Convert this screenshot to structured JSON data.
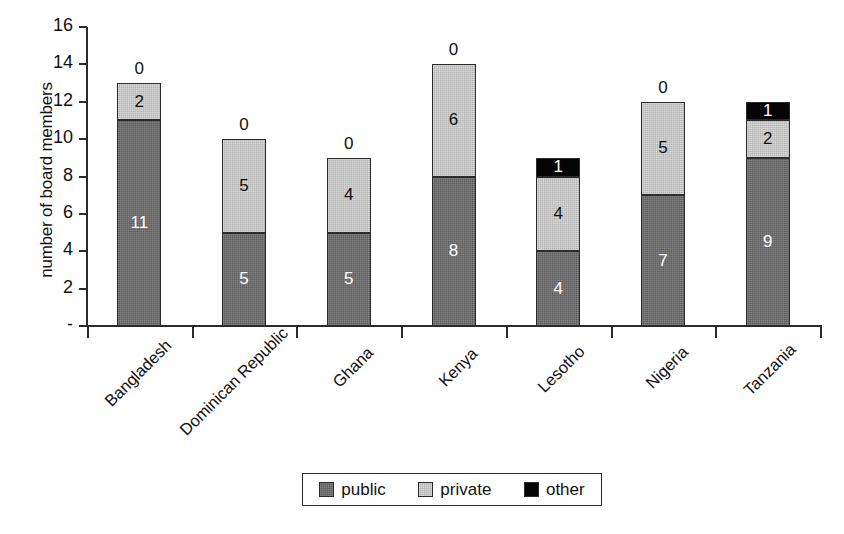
{
  "chart_data": {
    "type": "bar",
    "subtype": "stacked-bar",
    "title": "",
    "xlabel": "",
    "ylabel": "number of board members",
    "ylim": [
      0,
      16
    ],
    "ytick_values": [
      16,
      14,
      12,
      10,
      8,
      6,
      4,
      2,
      0
    ],
    "ytick_labels": [
      "16",
      "14",
      "12",
      "10",
      "8",
      "6",
      "4",
      "2",
      "-"
    ],
    "grid": false,
    "legend_position": "bottom",
    "categories": [
      "Bangladesh",
      "Dominican Republic",
      "Ghana",
      "Kenya",
      "Lesotho",
      "Nigeria",
      "Tanzania"
    ],
    "series": [
      {
        "name": "public",
        "color": "#5b5b5b",
        "values": [
          11,
          5,
          5,
          8,
          4,
          7,
          9
        ]
      },
      {
        "name": "private",
        "color": "#b2b2b2",
        "values": [
          2,
          5,
          4,
          6,
          4,
          5,
          2
        ]
      },
      {
        "name": "other",
        "color": "#050505",
        "values": [
          0,
          0,
          0,
          0,
          1,
          0,
          1
        ]
      }
    ],
    "totals": [
      13,
      10,
      9,
      14,
      9,
      12,
      12
    ],
    "bar_top_labels": [
      "0",
      "0",
      "0",
      "0",
      "",
      "0",
      ""
    ],
    "annotations": "Segment values are printed inside each stack segment; the 'other' count is printed above the bar when it is zero."
  },
  "legend": {
    "items": [
      {
        "label": "public",
        "swatch": "dark-gray-swatch"
      },
      {
        "label": "private",
        "swatch": "light-gray-swatch"
      },
      {
        "label": "other",
        "swatch": "black-swatch"
      }
    ]
  }
}
